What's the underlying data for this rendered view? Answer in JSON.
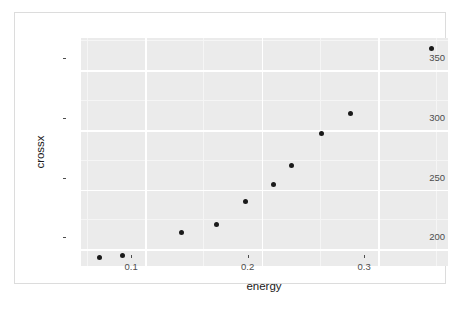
{
  "chart_data": {
    "type": "scatter",
    "title": "",
    "xlabel": "energy",
    "ylabel": "crossx",
    "xlim": [
      0.045,
      0.36
    ],
    "ylim": [
      186,
      377
    ],
    "grid": true,
    "legend": null,
    "xticks": [
      {
        "value": 0.1,
        "label": "0.1"
      },
      {
        "value": 0.2,
        "label": "0.2"
      },
      {
        "value": 0.3,
        "label": "0.3"
      }
    ],
    "yticks": [
      {
        "value": 200,
        "label": "200"
      },
      {
        "value": 250,
        "label": "250"
      },
      {
        "value": 300,
        "label": "300"
      },
      {
        "value": 350,
        "label": "350"
      }
    ],
    "xminor": [
      0.05,
      0.15,
      0.25,
      0.35
    ],
    "yminor": [
      175,
      225,
      275,
      325,
      375
    ],
    "x": [
      0.061,
      0.081,
      0.131,
      0.161,
      0.186,
      0.21,
      0.226,
      0.251,
      0.276,
      0.346
    ],
    "y": [
      193,
      195,
      214,
      221,
      240,
      254,
      270,
      297,
      314,
      368
    ],
    "points": [
      {
        "x": 0.061,
        "y": 193
      },
      {
        "x": 0.081,
        "y": 195
      },
      {
        "x": 0.131,
        "y": 214
      },
      {
        "x": 0.161,
        "y": 221
      },
      {
        "x": 0.186,
        "y": 240
      },
      {
        "x": 0.21,
        "y": 254
      },
      {
        "x": 0.226,
        "y": 270
      },
      {
        "x": 0.251,
        "y": 297
      },
      {
        "x": 0.276,
        "y": 314
      },
      {
        "x": 0.346,
        "y": 368
      }
    ],
    "marker": {
      "shape": "circle",
      "color": "#1a1a1a",
      "size": 5
    },
    "panel_background": "#ebebeb",
    "grid_color": "#ffffff",
    "page_background": "#ffffff"
  }
}
